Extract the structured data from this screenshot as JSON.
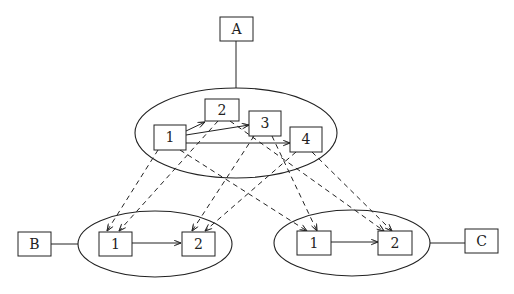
{
  "diagram": {
    "type": "hierarchical-graph",
    "external_nodes": [
      {
        "id": "A",
        "label": "A"
      },
      {
        "id": "B",
        "label": "B"
      },
      {
        "id": "C",
        "label": "C"
      }
    ],
    "clusters": {
      "top": {
        "attached_to": "A",
        "nodes": [
          "1",
          "2",
          "3",
          "4"
        ]
      },
      "left": {
        "attached_to": "B",
        "nodes": [
          "1",
          "2"
        ]
      },
      "right": {
        "attached_to": "C",
        "nodes": [
          "1",
          "2"
        ]
      }
    },
    "solid_edges": [
      {
        "from": "top.1",
        "to": "top.2"
      },
      {
        "from": "top.1",
        "to": "top.3"
      },
      {
        "from": "top.1",
        "to": "top.4"
      },
      {
        "from": "left.1",
        "to": "left.2"
      },
      {
        "from": "right.1",
        "to": "right.2"
      }
    ],
    "dashed_edges": [
      {
        "from": "top.1",
        "to": "left.1"
      },
      {
        "from": "top.1",
        "to": "right.1"
      },
      {
        "from": "top.2",
        "to": "left.1"
      },
      {
        "from": "top.2",
        "to": "right.2"
      },
      {
        "from": "top.3",
        "to": "left.2"
      },
      {
        "from": "top.3",
        "to": "right.1"
      },
      {
        "from": "top.4",
        "to": "left.2"
      },
      {
        "from": "top.4",
        "to": "right.2"
      }
    ],
    "labels": {
      "A": "A",
      "B": "B",
      "C": "C",
      "t1": "1",
      "t2": "2",
      "t3": "3",
      "t4": "4",
      "l1": "1",
      "l2": "2",
      "r1": "1",
      "r2": "2"
    },
    "colors": {
      "stroke": "#222222",
      "background": "#ffffff"
    }
  }
}
